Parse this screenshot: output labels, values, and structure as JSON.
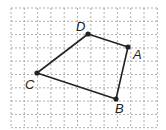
{
  "figure": {
    "type": "quadrilateral-on-grid",
    "grid": {
      "x0": 11,
      "y0": 8,
      "cols": 11,
      "rows": 9,
      "spacing": 13.3,
      "color": "#9a9a9a"
    },
    "points": [
      {
        "name": "A",
        "x": 128,
        "y": 47,
        "label_x": 133,
        "label_y": 48
      },
      {
        "name": "B",
        "x": 116,
        "y": 99,
        "label_x": 115,
        "label_y": 102
      },
      {
        "name": "C",
        "x": 37,
        "y": 73,
        "label_x": 25,
        "label_y": 78
      },
      {
        "name": "D",
        "x": 88,
        "y": 34,
        "label_x": 76,
        "label_y": 20
      }
    ],
    "edges": [
      [
        "D",
        "A"
      ],
      [
        "A",
        "B"
      ],
      [
        "B",
        "C"
      ],
      [
        "C",
        "D"
      ]
    ],
    "stroke_color": "#222222"
  }
}
